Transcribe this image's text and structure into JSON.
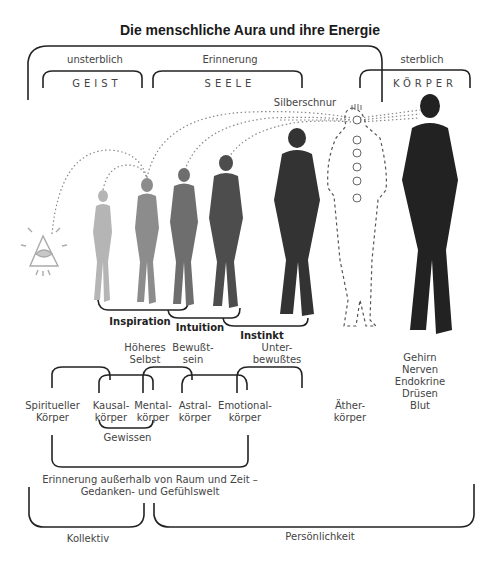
{
  "title": "Die menschliche Aura und ihre Energie",
  "top_groups": {
    "unsterblich": "unsterblich",
    "erinnerung": "Erinnerung",
    "sterblich": "sterblich",
    "geist": "GEIST",
    "seele": "SEELE",
    "koerper": "KÖRPER"
  },
  "silberschnur": "Silberschnur",
  "figures": [
    {
      "name": "eye-of-providence",
      "tone": "#b0b0b0"
    },
    {
      "name": "figure-1",
      "tone": "#b5b5b5"
    },
    {
      "name": "figure-2",
      "tone": "#8c8c8c"
    },
    {
      "name": "figure-3",
      "tone": "#6e6e6e"
    },
    {
      "name": "figure-4",
      "tone": "#4d4d4d"
    },
    {
      "name": "figure-5",
      "tone": "#3a3a3a"
    },
    {
      "name": "etheric-outline",
      "tone": "#555555"
    },
    {
      "name": "physical-body",
      "tone": "#222222"
    }
  ],
  "faculties": {
    "inspiration": "Inspiration",
    "intuition": "Intuition",
    "instinkt": "Instinkt"
  },
  "consciousness": {
    "hoeheres_selbst": [
      "Höheres",
      "Selbst"
    ],
    "bewusstsein": [
      "Bewußt-",
      "sein"
    ],
    "unterbewusstes": [
      "Unter-",
      "bewußtes"
    ]
  },
  "bodies": {
    "spirituell": [
      "Spiritueller",
      "Körper"
    ],
    "kausal": [
      "Kausal-",
      "körper"
    ],
    "mental": [
      "Mental-",
      "körper"
    ],
    "astral": [
      "Astral-",
      "körper"
    ],
    "emotional": [
      "Emotional-",
      "körper"
    ],
    "aether": [
      "Äther-",
      "körper"
    ]
  },
  "physical_list": [
    "Gehirn",
    "Nerven",
    "Endokrine",
    "Drüsen",
    "Blut"
  ],
  "gewissen": "Gewissen",
  "erinnerung_ausserhalb": [
    "Erinnerung außerhalb von Raum und Zeit –",
    "Gedanken- und Gefühlswelt"
  ],
  "kollektiv": "Kollektiv",
  "persoenlichkeit": "Persönlichkeit",
  "colors": {
    "line": "#222222",
    "text": "#444444",
    "dotted": "#888888"
  }
}
